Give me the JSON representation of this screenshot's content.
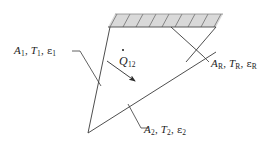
{
  "figure": {
    "kind": "radiation-enclosure-diagram",
    "background_color": "#ffffff",
    "line_color": "#3a3a3a",
    "wall_fill_color": "#d9d9d9",
    "wall_hatch_color": "#6e6e6e",
    "text_color": "#1c1c1c"
  },
  "labels": {
    "surface1": {
      "area": "A",
      "area_sub": "1",
      "temp": "T",
      "temp_sub": "1",
      "emissivity": "ε",
      "emissivity_sub": "1",
      "sep": ", ",
      "full_text": "A1, T1, ε1"
    },
    "surface2": {
      "area": "A",
      "area_sub": "2",
      "temp": "T",
      "temp_sub": "2",
      "emissivity": "ε",
      "emissivity_sub": "2",
      "sep": ", ",
      "full_text": "A2, T2, ε2"
    },
    "reradiating_surface": {
      "area": "A",
      "area_sub": "R",
      "temp": "T",
      "temp_sub": "R",
      "emissivity": "ε",
      "emissivity_sub": "R",
      "sep": ", ",
      "full_text": "AR, TR, εR"
    },
    "heat_rate": {
      "symbol": "Q",
      "sub": "12",
      "full_text": "Q̇12"
    }
  },
  "geometry": {
    "apex": [
      88,
      133
    ],
    "surface1_top": [
      110,
      27
    ],
    "wall_left": [
      108,
      27
    ],
    "wall_right": [
      216,
      27
    ],
    "wall_top_left": [
      115,
      14
    ],
    "wall_top_right": [
      223,
      14
    ],
    "hatch_count": 8,
    "arrow_from": [
      108,
      62
    ],
    "arrow_to": [
      138,
      83
    ]
  }
}
